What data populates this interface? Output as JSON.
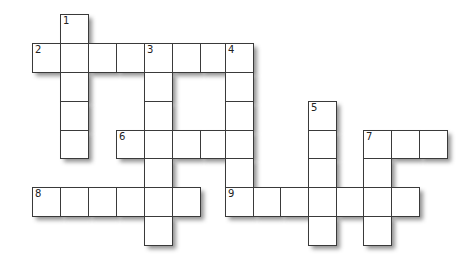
{
  "puzzle": {
    "type": "crossword",
    "cols": [
      32,
      60,
      88,
      116,
      144,
      172,
      200,
      225,
      253,
      280,
      308,
      336,
      363,
      391,
      419,
      447
    ],
    "rows": [
      14,
      43,
      72,
      101,
      130,
      158,
      187,
      216,
      245
    ],
    "clues": [
      {
        "number": "1",
        "direction": "down",
        "col": 1,
        "row": 0,
        "length": 5
      },
      {
        "number": "2",
        "direction": "across",
        "col": 0,
        "row": 1,
        "length": 8
      },
      {
        "number": "3",
        "direction": "down",
        "col": 4,
        "row": 1,
        "length": 7
      },
      {
        "number": "4",
        "direction": "down",
        "col": 7,
        "row": 1,
        "length": 6
      },
      {
        "number": "5",
        "direction": "down",
        "col": 10,
        "row": 3,
        "length": 5
      },
      {
        "number": "6",
        "direction": "across",
        "col": 3,
        "row": 4,
        "length": 5
      },
      {
        "number": "7",
        "direction": "across",
        "col": 12,
        "row": 4,
        "length": 3
      },
      {
        "number": "7",
        "direction": "down",
        "col": 12,
        "row": 4,
        "length": 4
      },
      {
        "number": "8",
        "direction": "across",
        "col": 0,
        "row": 6,
        "length": 6
      },
      {
        "number": "9",
        "direction": "across",
        "col": 7,
        "row": 6,
        "length": 7
      }
    ]
  }
}
